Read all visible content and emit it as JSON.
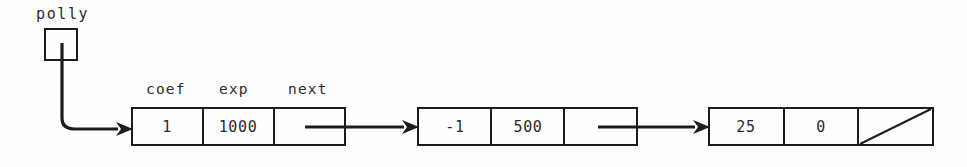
{
  "figure": {
    "kind": "linked-list-diagram",
    "background_color": "#fdfdfd",
    "ink_color": "#1c1c1c",
    "pointer_variable": {
      "name": "polly",
      "box_label": ""
    },
    "field_labels": {
      "coef": "coef",
      "exp": "exp",
      "next": "next"
    },
    "nodes": [
      {
        "id": "node-1",
        "coef": "1",
        "exp": "1000",
        "next": "pointer",
        "next_value": ""
      },
      {
        "id": "node-2",
        "coef": "-1",
        "exp": "500",
        "next": "pointer",
        "next_value": ""
      },
      {
        "id": "node-3",
        "coef": "25",
        "exp": "0",
        "next": "null",
        "next_value": ""
      }
    ],
    "links": [
      {
        "from": "polly",
        "to": "node-1"
      },
      {
        "from": "node-1",
        "to": "node-2"
      },
      {
        "from": "node-2",
        "to": "node-3"
      }
    ]
  }
}
